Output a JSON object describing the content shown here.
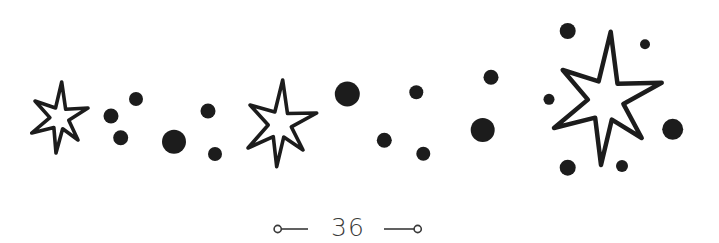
{
  "page": {
    "number": "36",
    "ink_color": "#1c1c1c",
    "footer_color": "#3a3a3a",
    "background": "#ffffff"
  },
  "stars": [
    {
      "name": "star-small-left",
      "tips": [
        [
          61.7,
          82
        ],
        [
          88,
          108
        ],
        [
          78,
          140
        ],
        [
          56,
          153
        ],
        [
          31.7,
          133
        ],
        [
          35,
          101
        ]
      ],
      "center": [
        60,
        118
      ]
    },
    {
      "name": "star-medium-middle",
      "tips": [
        [
          282.7,
          80
        ],
        [
          316.7,
          113
        ],
        [
          303,
          150
        ],
        [
          276.7,
          166.7
        ],
        [
          248,
          148
        ],
        [
          250,
          105
        ]
      ],
      "center": [
        280,
        124
      ]
    },
    {
      "name": "star-large-right",
      "tips": [
        [
          610.7,
          31.7
        ],
        [
          661.7,
          82.7
        ],
        [
          641.7,
          138
        ],
        [
          601,
          165
        ],
        [
          554,
          128
        ],
        [
          562.7,
          70
        ]
      ],
      "center": [
        606,
        100
      ]
    }
  ],
  "dots": [
    {
      "cx": 136,
      "cy": 99,
      "r": 7
    },
    {
      "cx": 111,
      "cy": 116,
      "r": 7.5
    },
    {
      "cx": 120.7,
      "cy": 137.7,
      "r": 7.5
    },
    {
      "cx": 174,
      "cy": 141.7,
      "r": 12
    },
    {
      "cx": 208,
      "cy": 111,
      "r": 7.5
    },
    {
      "cx": 215,
      "cy": 154,
      "r": 7
    },
    {
      "cx": 347.3,
      "cy": 94,
      "r": 12.5
    },
    {
      "cx": 416.3,
      "cy": 92.3,
      "r": 7
    },
    {
      "cx": 491,
      "cy": 77.3,
      "r": 7.5
    },
    {
      "cx": 482.7,
      "cy": 130,
      "r": 12
    },
    {
      "cx": 384.3,
      "cy": 140.3,
      "r": 7.5
    },
    {
      "cx": 423.3,
      "cy": 153.7,
      "r": 7
    },
    {
      "cx": 567.7,
      "cy": 31,
      "r": 8
    },
    {
      "cx": 645,
      "cy": 44.3,
      "r": 5
    },
    {
      "cx": 549,
      "cy": 99.3,
      "r": 5.5
    },
    {
      "cx": 672.7,
      "cy": 129.3,
      "r": 10.5
    },
    {
      "cx": 567.7,
      "cy": 167.7,
      "r": 8
    },
    {
      "cx": 622,
      "cy": 166,
      "r": 6
    }
  ]
}
